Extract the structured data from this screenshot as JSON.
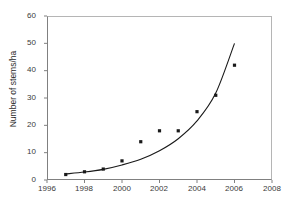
{
  "chart_data": {
    "type": "scatter",
    "title": "",
    "xlabel": "",
    "ylabel": "Number of stems/ha",
    "xlim": [
      1996,
      2008
    ],
    "ylim": [
      0,
      60
    ],
    "xticks": [
      1996,
      1998,
      2000,
      2002,
      2004,
      2006,
      2008
    ],
    "yticks": [
      0,
      10,
      20,
      30,
      40,
      50,
      60
    ],
    "grid": false,
    "legend": null,
    "marker_color": "#1a1a1a",
    "line_color": "#1a1a1a",
    "x": [
      1997,
      1998,
      1999,
      2000,
      2001,
      2002,
      2003,
      2004,
      2005,
      2006
    ],
    "values": [
      2,
      3,
      4,
      7,
      14,
      18,
      18,
      25,
      31,
      42
    ],
    "series": [
      {
        "name": "Observed stems/ha",
        "type": "scatter",
        "x": [
          1997,
          1998,
          1999,
          2000,
          2001,
          2002,
          2003,
          2004,
          2005,
          2006
        ],
        "values": [
          2,
          3,
          4,
          7,
          14,
          18,
          18,
          25,
          31,
          42
        ]
      },
      {
        "name": "Exponential trend line",
        "type": "line",
        "x": [
          1997,
          1998,
          1999,
          2000,
          2001,
          2002,
          2003,
          2004,
          2005,
          2006
        ],
        "values": [
          2.2,
          2.9,
          3.9,
          5.5,
          7.6,
          10.7,
          15.1,
          21.6,
          31.8,
          50.0
        ]
      }
    ]
  },
  "axes": {
    "y_tick_labels": [
      "60",
      "50",
      "40",
      "30",
      "20",
      "10",
      "0"
    ],
    "x_tick_labels": [
      "1996",
      "1998",
      "2000",
      "2002",
      "2004",
      "2006",
      "2008"
    ],
    "y_title": "Number of stems/ha"
  }
}
